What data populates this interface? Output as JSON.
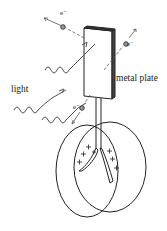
{
  "diagram": {
    "labels": {
      "light": "light",
      "metal_plate": "metal plate",
      "electron": "e⁻"
    },
    "electrons": [
      {
        "id": "e1",
        "label": "e⁻"
      },
      {
        "id": "e2",
        "label": "e⁻"
      },
      {
        "id": "e3",
        "label": "e⁻"
      }
    ],
    "charges": {
      "symbol": "+",
      "count": 9
    },
    "colors": {
      "line": "#222222",
      "electron_fill": "#888888",
      "background": "#ffffff"
    }
  }
}
